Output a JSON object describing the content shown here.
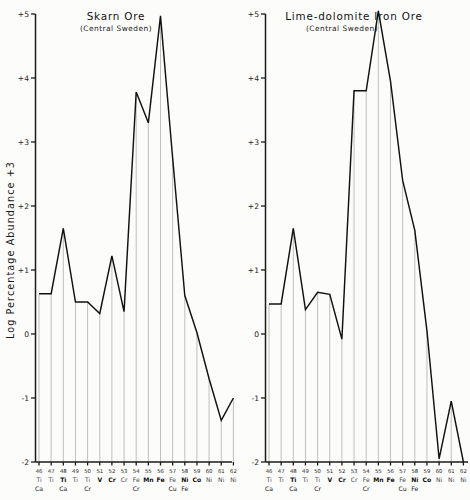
{
  "figure": {
    "y_axis_title": "Log Percentage Abundance +3",
    "y_ticks": [
      "+5",
      "+4",
      "+3",
      "+2",
      "+1",
      "0",
      "-1",
      "-2"
    ],
    "y_tick_values": [
      5,
      4,
      3,
      2,
      1,
      0,
      -1,
      -2
    ],
    "ylim": [
      -2,
      5
    ],
    "mass_numbers": [
      "46",
      "47",
      "48",
      "49",
      "50",
      "51",
      "52",
      "53",
      "54",
      "55",
      "56",
      "57",
      "58",
      "59",
      "60",
      "61",
      "62"
    ],
    "element_row1": [
      "Ti",
      "Ti",
      "Ti",
      "Ti",
      "Ti",
      "V",
      "Cr",
      "Cr",
      "Fe",
      "Mn",
      "Fe",
      "Fe",
      "Ni",
      "Co",
      "Ni",
      "Ni",
      "Ni"
    ],
    "element_row2": [
      "Ca",
      "",
      "Ca",
      "",
      "Cr",
      "",
      "",
      "",
      "Cr",
      "",
      "",
      "Cu",
      "Fe",
      "",
      "",
      "",
      ""
    ],
    "bold_flags": [
      false,
      false,
      true,
      false,
      false,
      true,
      true,
      false,
      false,
      true,
      true,
      false,
      true,
      true,
      false,
      false,
      false
    ]
  },
  "panels": [
    {
      "id": "skarn-ore",
      "title": "Skarn Ore",
      "subtitle": "(Central Sweden)"
    },
    {
      "id": "lime-dolomite-iron-ore",
      "title": "Lime-dolomite Iron Ore",
      "subtitle": "(Central Sweden)"
    }
  ],
  "chart_data": [
    {
      "type": "line",
      "title": "Skarn Ore",
      "subtitle": "(Central Sweden)",
      "xlabel": "",
      "ylabel": "Log Percentage Abundance +3",
      "ylim": [
        -2,
        5
      ],
      "grid": true,
      "legend": "none",
      "categories": [
        "46",
        "47",
        "48",
        "49",
        "50",
        "51",
        "52",
        "53",
        "54",
        "55",
        "56",
        "57",
        "58",
        "59",
        "60",
        "61",
        "62"
      ],
      "x_element_labels": [
        "Ti/Ca",
        "Ti",
        "Ti/Ca",
        "Ti",
        "Ti/Cr",
        "V",
        "Cr",
        "Cr",
        "Fe/Cr",
        "Mn",
        "Fe",
        "Fe/Cu",
        "Ni/Fe",
        "Co",
        "Ni",
        "Ni",
        "Ni"
      ],
      "values": [
        0.63,
        0.63,
        1.65,
        0.5,
        0.5,
        0.32,
        1.22,
        0.35,
        3.78,
        3.3,
        4.97,
        2.75,
        0.6,
        0.02,
        -0.7,
        -1.35,
        -1.0
      ]
    },
    {
      "type": "line",
      "title": "Lime-dolomite Iron Ore",
      "subtitle": "(Central Sweden)",
      "xlabel": "",
      "ylabel": "Log Percentage Abundance +3",
      "ylim": [
        -2,
        5
      ],
      "grid": true,
      "legend": "none",
      "categories": [
        "46",
        "47",
        "48",
        "49",
        "50",
        "51",
        "52",
        "53",
        "54",
        "55",
        "56",
        "57",
        "58",
        "59",
        "60",
        "61",
        "62"
      ],
      "x_element_labels": [
        "Ti/Ca",
        "Ti",
        "Ti/Ca",
        "Ti",
        "Ti/Cr",
        "V",
        "Cr",
        "Cr",
        "Fe/Cr",
        "Mn",
        "Fe",
        "Fe/Cu",
        "Ni/Fe",
        "Co",
        "Ni",
        "Ni",
        "Ni"
      ],
      "values": [
        0.47,
        0.47,
        1.65,
        0.38,
        0.65,
        0.62,
        -0.08,
        3.8,
        3.8,
        5.05,
        3.95,
        2.4,
        1.62,
        0.05,
        -1.95,
        -1.05,
        -2.0
      ]
    }
  ]
}
